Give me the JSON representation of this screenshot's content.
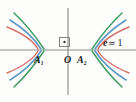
{
  "figure": {
    "type": "conic-sections-diagram",
    "background_color": "#fdfdfc",
    "width": 136,
    "height": 102,
    "axes": {
      "color": "#8d8d8d",
      "x_axis": {
        "y": 50,
        "x_start": 0,
        "x_end": 136
      },
      "y_axis": {
        "x": 68,
        "y_start": 8,
        "y_end": 95
      },
      "origin": {
        "x": 68,
        "y": 50
      },
      "right_angle_marker": {
        "x": 60,
        "y": 37,
        "size": 10,
        "has_center_dot": true
      }
    },
    "labels": {
      "a1": {
        "text": "A",
        "sub": "1"
      },
      "origin": {
        "text": "O"
      },
      "a2": {
        "text": "A",
        "sub": "2"
      },
      "eccentricity": {
        "variable": "e",
        "operator": "≃",
        "value": "1"
      }
    },
    "curves": [
      {
        "name": "outer-branch-pair",
        "color": "#3f9e62",
        "vertex_left_x": 44,
        "vertex_right_x": 92,
        "order": "outer"
      },
      {
        "name": "middle-branch-pair",
        "color": "#5d97c4",
        "vertex_left_x": 41,
        "vertex_right_x": 95,
        "order": "middle"
      },
      {
        "name": "inner-branch-pair",
        "color": "#d4726c",
        "vertex_left_x": 38,
        "vertex_right_x": 98,
        "order": "inner"
      }
    ],
    "colors": {
      "green": "#3f9e62",
      "blue": "#5d97c4",
      "red": "#d4726c",
      "axis_gray": "#8d8d8d",
      "label_black": "#1b1b1b"
    }
  }
}
